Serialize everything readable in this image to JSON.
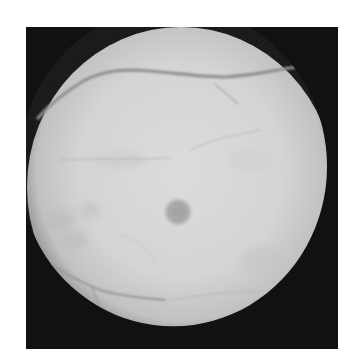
{
  "image": {
    "subject": "retinal fundus photograph",
    "mode": "grayscale",
    "background_color": "#ffffff",
    "frame": {
      "x": 26,
      "y": 27,
      "width": 312,
      "height": 322,
      "color": "#111111"
    },
    "fundus_disc": {
      "cx": 181,
      "cy": 187,
      "rx": 154,
      "ry": 160,
      "center_color": "#dcdcdc",
      "edge_color": "#8a8a8a"
    },
    "notch": {
      "x": 293,
      "y": 66
    },
    "macula": {
      "cx": 178,
      "cy": 212,
      "r": 13,
      "color": "#a4a4a4"
    },
    "vessel_color": "#8c8c8c",
    "caption": "Grayscale retinal fundus image"
  }
}
